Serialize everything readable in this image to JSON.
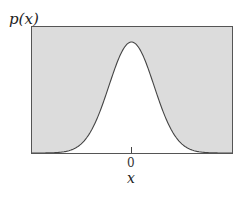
{
  "chart_data": {
    "type": "area",
    "title": "",
    "ylabel": "p(x)",
    "xlabel": "x",
    "x_ticks": [
      "0"
    ],
    "series": [
      {
        "name": "p(x)",
        "x": [
          -4,
          -3,
          -2,
          -1.5,
          -1,
          -0.5,
          0,
          0.5,
          1,
          1.5,
          2,
          3,
          4
        ],
        "values": [
          0.0003,
          0.011,
          0.135,
          0.325,
          0.607,
          0.882,
          1.0,
          0.882,
          0.607,
          0.325,
          0.135,
          0.011,
          0.0003
        ]
      }
    ],
    "xlim": [
      -4.5,
      4.5
    ],
    "ylim": [
      0,
      1.1
    ],
    "grid": false,
    "legend": "none",
    "colors": {
      "shade": "#d9d9d9",
      "curve": "#444444",
      "frame": "#555555"
    }
  },
  "labels": {
    "ylabel": "p(x)",
    "xlabel": "x",
    "tick0": "0"
  }
}
